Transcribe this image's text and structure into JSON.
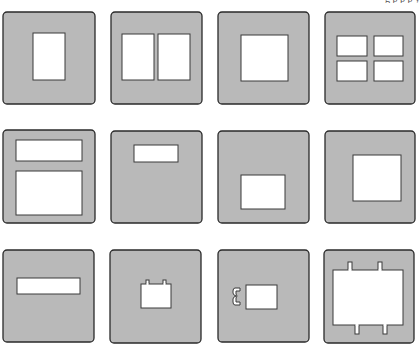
{
  "page": {
    "top_text_fragment": "g  p  p  p y",
    "panel_color": "#b9b9b9",
    "window_color": "#ffffff",
    "outline_color": "#2a2a2a"
  },
  "diagrams": [
    {
      "id": "d1",
      "label": "single-vertical-window",
      "panel": [
        3,
        12,
        92,
        92
      ],
      "windows": [
        [
          33,
          33,
          32,
          47
        ]
      ]
    },
    {
      "id": "d2",
      "label": "two-vertical-windows",
      "panel": [
        111,
        12,
        91,
        92
      ],
      "windows": [
        [
          122,
          34,
          32,
          46
        ],
        [
          158,
          34,
          32,
          46
        ]
      ]
    },
    {
      "id": "d3",
      "label": "single-square-window",
      "panel": [
        218,
        12,
        91,
        92
      ],
      "windows": [
        [
          241,
          35,
          47,
          46
        ]
      ]
    },
    {
      "id": "d4",
      "label": "four-pane-window",
      "panel": [
        325,
        12,
        90,
        92
      ],
      "windows": [
        [
          337,
          36,
          30,
          20
        ],
        [
          374,
          36,
          29,
          20
        ],
        [
          337,
          61,
          30,
          20
        ],
        [
          374,
          61,
          29,
          20
        ]
      ]
    },
    {
      "id": "d5",
      "label": "stacked-horizontal-windows",
      "panel": [
        3,
        130,
        92,
        93
      ],
      "windows": [
        [
          16,
          140,
          66,
          21
        ],
        [
          16,
          171,
          66,
          44
        ]
      ]
    },
    {
      "id": "d6",
      "label": "small-high-window",
      "panel": [
        111,
        131,
        91,
        92
      ],
      "windows": [
        [
          134,
          145,
          44,
          17
        ]
      ]
    },
    {
      "id": "d7",
      "label": "low-centered-window",
      "panel": [
        218,
        131,
        91,
        92
      ],
      "windows": [
        [
          241,
          175,
          44,
          34
        ]
      ]
    },
    {
      "id": "d8",
      "label": "offset-square-window",
      "panel": [
        325,
        131,
        90,
        92
      ],
      "windows": [
        [
          353,
          155,
          48,
          46
        ]
      ]
    },
    {
      "id": "d9",
      "label": "slot-window",
      "panel": [
        3,
        250,
        91,
        92
      ],
      "windows": [
        [
          17,
          278,
          63,
          16
        ]
      ]
    },
    {
      "id": "d10",
      "label": "window-with-top-tabs",
      "panel": [
        110,
        250,
        91,
        93
      ],
      "windows": [
        [
          141,
          284,
          30,
          24
        ]
      ],
      "tabs": [
        [
          146,
          280,
          3,
          5
        ],
        [
          163,
          280,
          3,
          5
        ]
      ]
    },
    {
      "id": "d11",
      "label": "window-with-side-hook",
      "panel": [
        218,
        250,
        91,
        92
      ],
      "windows": [
        [
          246,
          285,
          31,
          24
        ]
      ],
      "hook": [
        233,
        288,
        7,
        17
      ]
    },
    {
      "id": "d12",
      "label": "large-window-with-tabs",
      "panel": [
        324,
        250,
        90,
        93
      ],
      "windows": [
        [
          333,
          270,
          70,
          55
        ]
      ],
      "tabs": [
        [
          348,
          262,
          4,
          9
        ],
        [
          378,
          262,
          4,
          9
        ],
        [
          355,
          324,
          4,
          10
        ],
        [
          383,
          324,
          4,
          10
        ]
      ]
    }
  ]
}
